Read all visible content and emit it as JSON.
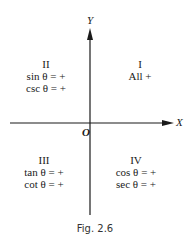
{
  "figure": {
    "caption": "Fig. 2.6",
    "axes": {
      "x_label": "X",
      "y_label": "Y",
      "origin_label": "O"
    },
    "quadrants": [
      {
        "numeral": "I",
        "lines": [
          "All +"
        ]
      },
      {
        "numeral": "II",
        "lines": [
          "sin θ = +",
          "csc θ = +"
        ]
      },
      {
        "numeral": "III",
        "lines": [
          "tan θ = +",
          "cot θ = +"
        ]
      },
      {
        "numeral": "IV",
        "lines": [
          "cos θ = +",
          "sec θ = +"
        ]
      }
    ]
  }
}
